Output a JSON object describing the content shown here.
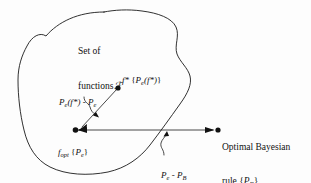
{
  "figure": {
    "kind": "concept-diagram",
    "background_color": "#fdfdfd",
    "ink_color": "#1a1a1a",
    "labels": {
      "set_of_functions_line1": "Set of",
      "set_of_functions_line2": "functions",
      "script_f": "ℱ",
      "f_star_name": "f",
      "f_star_superscript": "*",
      "f_star_bracket_open": " {",
      "f_star_p": "P",
      "f_star_p_sub": "e",
      "f_star_arg": "(f",
      "f_star_arg_star": "*",
      "f_star_arg_close": ")",
      "f_star_bracket_close": "}",
      "excess_p1": "P",
      "excess_p1_sub": "e",
      "excess_arg": "(f",
      "excess_arg_star": "*",
      "excess_arg_close": ")",
      "excess_minus": " - ",
      "excess_p2": "P",
      "excess_p2_sub": "e",
      "f_opt_name": "f",
      "f_opt_sub": "opt",
      "f_opt_bracket_open": " {",
      "f_opt_p": "P",
      "f_opt_p_sub": "e",
      "f_opt_bracket_close": "}",
      "bayes_line1": "Optimal Bayesian",
      "bayes_line2_prefix": "rule {",
      "bayes_line2_p": "P",
      "bayes_line2_sub": "B",
      "bayes_line2_suffix": "}",
      "gap_p1": "P",
      "gap_p1_sub": "e",
      "gap_minus": " - ",
      "gap_p2": "P",
      "gap_p2_sub": "B"
    },
    "nodes": [
      {
        "name": "f-star-point",
        "x": 118,
        "y": 88
      },
      {
        "name": "f-opt-point",
        "x": 75,
        "y": 130
      },
      {
        "name": "bayes-point",
        "x": 218,
        "y": 130
      }
    ],
    "arrows": [
      {
        "name": "excess-risk-arrow",
        "from": [
          118,
          88
        ],
        "to": [
          79,
          128
        ],
        "head_at": "to"
      },
      {
        "name": "bayes-gap-arrow",
        "from": [
          79,
          130
        ],
        "to": [
          215,
          130
        ],
        "head_at": "both"
      }
    ]
  }
}
